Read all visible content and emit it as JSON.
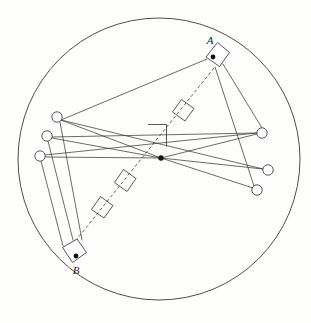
{
  "figure": {
    "canvas": {
      "width": 311,
      "height": 323,
      "background": "#fdfdfc"
    },
    "stroke_color": "#3a3a3a",
    "fill_color": "#ffffff",
    "dot_color": "#111111"
  },
  "boundary": {
    "name": "outer-circle",
    "cx": 159,
    "cy": 159,
    "r": 141
  },
  "center": {
    "name": "center-point",
    "x": 161,
    "y": 158,
    "r": 2.6
  },
  "points": [
    {
      "id": "A",
      "label": "A",
      "dot_x": 213,
      "dot_y": 57,
      "dot_r": 2.4,
      "label_x": 210,
      "label_y": 44,
      "box": "217.5,42.5 229.5,52.5 219.5,66.5 206.0,57.0"
    },
    {
      "id": "B",
      "label": "B",
      "dot_x": 76,
      "dot_y": 256,
      "dot_r": 2.4,
      "label_x": 76,
      "label_y": 273,
      "box": "62.5,247.5 77.0,239.0 86.5,252.5 72.5,262.5"
    }
  ],
  "left_nodes": [
    {
      "id": "L1",
      "x": 57,
      "y": 117,
      "r": 5.2
    },
    {
      "id": "L2",
      "x": 47,
      "y": 136,
      "r": 5.2
    },
    {
      "id": "L3",
      "x": 40,
      "y": 156,
      "r": 5.2
    }
  ],
  "right_nodes": [
    {
      "id": "R1",
      "x": 262,
      "y": 133,
      "r": 5.2
    },
    {
      "id": "R2",
      "x": 268,
      "y": 170,
      "r": 5.2
    },
    {
      "id": "R3",
      "x": 257,
      "y": 190,
      "r": 5.2
    }
  ],
  "rays_to_center": [
    {
      "from": "L1",
      "x1": 61,
      "y1": 120,
      "x2": 161,
      "y2": 158
    },
    {
      "from": "L2",
      "x1": 52,
      "y1": 138,
      "x2": 161,
      "y2": 158
    },
    {
      "from": "L3",
      "x1": 45,
      "y1": 157,
      "x2": 161,
      "y2": 158
    },
    {
      "from": "R1",
      "x1": 257,
      "y1": 134,
      "x2": 161,
      "y2": 158
    },
    {
      "from": "R2",
      "x1": 263,
      "y1": 169,
      "x2": 161,
      "y2": 158
    },
    {
      "from": "R3",
      "x1": 253,
      "y1": 188,
      "x2": 161,
      "y2": 158
    }
  ],
  "cross_chords": [
    {
      "name": "chord-L1-R2",
      "x1": 61,
      "y1": 120,
      "x2": 263,
      "y2": 169
    },
    {
      "name": "chord-L2-R1",
      "x1": 52,
      "y1": 137,
      "x2": 257,
      "y2": 133
    },
    {
      "name": "chord-L3-R1",
      "x1": 45,
      "y1": 155,
      "x2": 257,
      "y2": 133
    },
    {
      "name": "chord-L1-A",
      "x1": 61,
      "y1": 120,
      "x2": 206,
      "y2": 58
    }
  ],
  "source_rays": [
    {
      "name": "ray-A-R1",
      "x1": 222,
      "y1": 65,
      "x2": 262,
      "y2": 128
    },
    {
      "name": "ray-A-R3",
      "x1": 216,
      "y1": 67,
      "x2": 254,
      "y2": 186
    },
    {
      "name": "ray-B-L2",
      "x1": 73,
      "y1": 240,
      "x2": 48,
      "y2": 141
    },
    {
      "name": "ray-B-L3",
      "x1": 63,
      "y1": 246,
      "x2": 40,
      "y2": 162
    },
    {
      "name": "ray-B-L1",
      "x1": 82,
      "y1": 240,
      "x2": 60,
      "y2": 122
    }
  ],
  "axis": {
    "name": "dashed-axis",
    "x1": 214,
    "y1": 68,
    "x2": 73,
    "y2": 244
  },
  "markers": [
    {
      "name": "marker-box-upper",
      "points": "181.5,99.5 194.0,108.5 185.0,121.0 172.5,112.0"
    },
    {
      "name": "marker-box-mid",
      "points": "123.5,169.5 136.0,178.5 127.0,191.5 114.5,182.5"
    },
    {
      "name": "marker-box-lower",
      "points": "100.5,196.5 113.0,205.5 104.0,218.0 91.5,209.5"
    }
  ],
  "right_angle_marker": {
    "name": "right-angle-marker",
    "points": "148.0,124.5 166.5,124.5 166.5,146.5"
  }
}
